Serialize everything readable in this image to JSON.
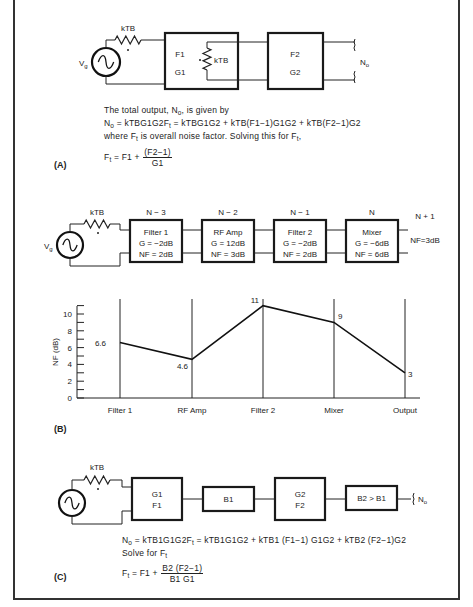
{
  "panels": {
    "A": {
      "label": "(A)",
      "circuit": {
        "source_label": "V",
        "source_sub": "g",
        "source_resistor_label": "kTB",
        "stage1": {
          "line1": "F1",
          "line2": "G1",
          "internal_resistor_label": "kTB"
        },
        "stage2": {
          "line1": "F2",
          "line2": "G2"
        },
        "output_label": "N",
        "output_sub": "o"
      },
      "text": {
        "line1_pre": "The total output, N",
        "line1_sub": "o",
        "line1_post": ", is given by",
        "line2_a": "N",
        "line2_a_sub": "o",
        "line2_b": " = kTBG1G2F",
        "line2_b_sub": "t",
        "line2_c": " = kTBG1G2 + kTB(F1−1)G1G2 + kTB(F2−1)G2",
        "line3_pre": "where F",
        "line3_sub": "t",
        "line3_mid": " is overall noise factor. Solving this for F",
        "line3_sub2": "t",
        "line3_post": ",",
        "formula_lhs": "F",
        "formula_lhs_sub": "t",
        "formula_mid": " = F1 + ",
        "formula_num": "(F2−1)",
        "formula_den": "G1"
      }
    },
    "B": {
      "label": "(B)",
      "circuit": {
        "source_label": "V",
        "source_sub": "g",
        "source_resistor_label": "kTB",
        "stages": [
          {
            "index": "N − 3",
            "name": "Filter 1",
            "gain": "G = −2dB",
            "nf": "NF = 2dB"
          },
          {
            "index": "N − 2",
            "name": "RF Amp",
            "gain": "G = 12dB",
            "nf": "NF = 3dB"
          },
          {
            "index": "N − 1",
            "name": "Filter 2",
            "gain": "G = −2dB",
            "nf": "NF = 2dB"
          },
          {
            "index": "N",
            "name": "Mixer",
            "gain": "G = −6dB",
            "nf": "NF = 6dB"
          }
        ],
        "next_stage": {
          "index": "N + 1",
          "nf": "NF=3dB"
        }
      }
    },
    "C": {
      "label": "(C)",
      "circuit": {
        "source_resistor_label": "kTB",
        "blocks": [
          {
            "line1": "G1",
            "line2": "F1"
          },
          {
            "line1": "B1",
            "line2": ""
          },
          {
            "line1": "G2",
            "line2": "F2"
          },
          {
            "line1": "B2 > B1",
            "line2": ""
          }
        ],
        "output_label": "N",
        "output_sub": "o"
      },
      "text": {
        "line1_a": "N",
        "line1_a_sub": "o",
        "line1_b": " = kTB1G1G2F",
        "line1_b_sub": "t",
        "line1_c": " = kTB1G1G2 + kTB1 (F1−1) G1G2 + kTB2 (F2−1)G2",
        "line2_pre": "Solve for F",
        "line2_sub": "t",
        "formula_lhs": "F",
        "formula_lhs_sub": "t",
        "formula_mid": " = F1 + ",
        "formula_num": "B2 (F2−1)",
        "formula_den": "B1 G1"
      }
    }
  },
  "chart_data": {
    "type": "line",
    "title": "",
    "xlabel": "",
    "ylabel": "NF (dB)",
    "categories": [
      "Filter 1",
      "RF Amp",
      "Filter 2",
      "Mixer",
      "Output"
    ],
    "values": [
      6.6,
      4.6,
      11,
      9,
      3
    ],
    "data_labels": [
      "6.6",
      "4.6",
      "11",
      "9",
      "3"
    ],
    "yticks": [
      0,
      2,
      4,
      6,
      8,
      10
    ],
    "ylim": [
      0,
      11
    ],
    "grid": false,
    "vertical_category_lines": true,
    "legend": "none"
  }
}
